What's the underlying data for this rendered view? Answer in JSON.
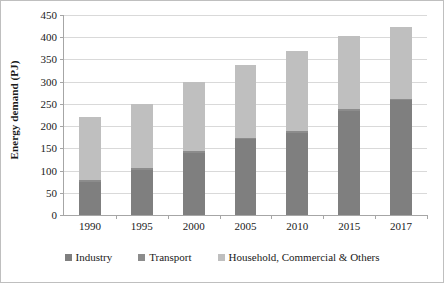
{
  "chart_data": {
    "type": "bar",
    "stacked": true,
    "title": "",
    "xlabel": "",
    "ylabel": "Energy demand (PJ)",
    "categories": [
      "1990",
      "1995",
      "2000",
      "2005",
      "2010",
      "2015",
      "2017"
    ],
    "ylim": [
      0,
      450
    ],
    "yticks": [
      "0",
      "50",
      "100",
      "150",
      "200",
      "250",
      "300",
      "350",
      "400",
      "450"
    ],
    "ytick_values": [
      0,
      50,
      100,
      150,
      200,
      250,
      300,
      350,
      400,
      450
    ],
    "grid": true,
    "legend_position": "bottom",
    "series": [
      {
        "name": "Industry",
        "color": "#7f7f7f",
        "values": [
          75,
          102,
          140,
          170,
          185,
          235,
          258
        ]
      },
      {
        "name": "Transport",
        "color": "#8c8c8c",
        "values": [
          3,
          3,
          3,
          3,
          3,
          3,
          3
        ]
      },
      {
        "name": "Household, Commercial & Others",
        "color": "#bfbfbf",
        "values": [
          142,
          145,
          157,
          164,
          182,
          164,
          161
        ]
      }
    ],
    "totals": [
      220,
      250,
      300,
      337,
      370,
      402,
      422
    ]
  },
  "legend": {
    "items": [
      {
        "label": "Industry"
      },
      {
        "label": "Transport"
      },
      {
        "label": "Household, Commercial & Others"
      }
    ]
  }
}
